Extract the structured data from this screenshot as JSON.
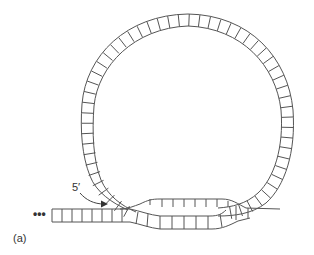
{
  "diagram": {
    "labels": {
      "five_prime": "5′",
      "continuation": "•••",
      "panel": "(a)"
    },
    "colors": {
      "stroke": "#555555",
      "background": "#ffffff",
      "text": "#333333"
    },
    "elements": [
      "double-stranded stem (left)",
      "large single-strand loop with rungs",
      "displacement region with top strand ticks",
      "curved arrow pointing to 5′ end"
    ]
  }
}
